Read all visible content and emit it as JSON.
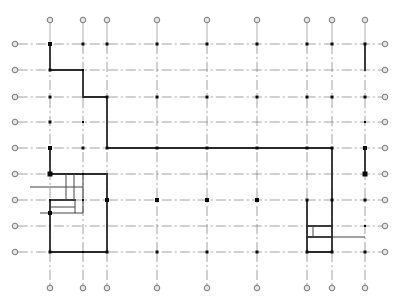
{
  "drawing": {
    "title": "Structural grid floor plan",
    "width": 406,
    "height": 303,
    "colors": {
      "grid": "#8a8a8a",
      "wall": "#2a2a2a",
      "column": "#0a0a0a",
      "bubble": "#e6e6e6"
    }
  },
  "grid": {
    "columns_x": [
      50,
      83,
      107,
      157,
      207,
      257,
      307,
      332,
      365
    ],
    "rows_y": [
      44,
      70,
      97,
      122,
      148,
      174,
      200,
      226,
      252
    ],
    "top_bubble_y": 20,
    "bottom_bubble_y": 288,
    "left_bubble_x": 15,
    "right_bubble_x": 385,
    "bubble_radius": 2.8
  },
  "columns": [
    {
      "x": 50,
      "y": 44,
      "s": 4
    },
    {
      "x": 83,
      "y": 44,
      "s": 3
    },
    {
      "x": 107,
      "y": 44,
      "s": 3
    },
    {
      "x": 157,
      "y": 44,
      "s": 3
    },
    {
      "x": 207,
      "y": 44,
      "s": 3
    },
    {
      "x": 257,
      "y": 44,
      "s": 3
    },
    {
      "x": 307,
      "y": 44,
      "s": 3
    },
    {
      "x": 332,
      "y": 44,
      "s": 3
    },
    {
      "x": 365,
      "y": 44,
      "s": 3
    },
    {
      "x": 50,
      "y": 70,
      "s": 3
    },
    {
      "x": 83,
      "y": 70,
      "s": 2
    },
    {
      "x": 50,
      "y": 97,
      "s": 3
    },
    {
      "x": 107,
      "y": 97,
      "s": 3
    },
    {
      "x": 157,
      "y": 97,
      "s": 3
    },
    {
      "x": 207,
      "y": 97,
      "s": 3
    },
    {
      "x": 257,
      "y": 97,
      "s": 3
    },
    {
      "x": 307,
      "y": 97,
      "s": 3
    },
    {
      "x": 332,
      "y": 97,
      "s": 3
    },
    {
      "x": 365,
      "y": 97,
      "s": 3
    },
    {
      "x": 50,
      "y": 122,
      "s": 3
    },
    {
      "x": 83,
      "y": 122,
      "s": 2
    },
    {
      "x": 365,
      "y": 122,
      "s": 2
    },
    {
      "x": 50,
      "y": 148,
      "s": 4
    },
    {
      "x": 83,
      "y": 148,
      "s": 3
    },
    {
      "x": 107,
      "y": 148,
      "s": 3
    },
    {
      "x": 157,
      "y": 148,
      "s": 3
    },
    {
      "x": 207,
      "y": 148,
      "s": 3
    },
    {
      "x": 257,
      "y": 148,
      "s": 3
    },
    {
      "x": 307,
      "y": 148,
      "s": 3
    },
    {
      "x": 332,
      "y": 148,
      "s": 3
    },
    {
      "x": 365,
      "y": 148,
      "s": 4
    },
    {
      "x": 50,
      "y": 174,
      "s": 5
    },
    {
      "x": 83,
      "y": 174,
      "s": 2
    },
    {
      "x": 365,
      "y": 174,
      "s": 5
    },
    {
      "x": 107,
      "y": 200,
      "s": 4
    },
    {
      "x": 157,
      "y": 200,
      "s": 4
    },
    {
      "x": 207,
      "y": 200,
      "s": 4
    },
    {
      "x": 257,
      "y": 200,
      "s": 4
    },
    {
      "x": 307,
      "y": 200,
      "s": 3
    },
    {
      "x": 332,
      "y": 200,
      "s": 3
    },
    {
      "x": 365,
      "y": 200,
      "s": 3
    },
    {
      "x": 83,
      "y": 200,
      "s": 2
    },
    {
      "x": 50,
      "y": 200,
      "s": 2
    },
    {
      "x": 50,
      "y": 213,
      "s": 4
    },
    {
      "x": 365,
      "y": 226,
      "s": 2
    },
    {
      "x": 50,
      "y": 252,
      "s": 3
    },
    {
      "x": 83,
      "y": 252,
      "s": 2
    },
    {
      "x": 107,
      "y": 252,
      "s": 3
    },
    {
      "x": 157,
      "y": 252,
      "s": 3
    },
    {
      "x": 207,
      "y": 252,
      "s": 3
    },
    {
      "x": 257,
      "y": 252,
      "s": 3
    },
    {
      "x": 307,
      "y": 252,
      "s": 3
    },
    {
      "x": 332,
      "y": 252,
      "s": 3
    },
    {
      "x": 365,
      "y": 252,
      "s": 3
    }
  ],
  "walls": [
    "M50 44 L50 70 L83 70 L83 97 L107 97 L107 148 L332 148 L332 252 L307 252 L307 200",
    "M365 44 L365 70",
    "M365 148 L365 174",
    "M50 148 L50 174",
    "M50 174 L107 174 L107 252 L50 252 L50 200",
    "M50 200 L75 200",
    "M307 226 L332 226",
    "M307 237 L332 237"
  ],
  "thin_lines": [
    "M66 174 L66 200",
    "M74 174 L74 200",
    "M83 174 L83 213",
    "M50 187 L83 187",
    "M50 207 L75 207",
    "M75 200 L75 213",
    "M50 213 L83 213",
    "M30 187 L50 187",
    "M40 213 L50 213",
    "M313 226 L313 237",
    "M332 237 L365 237"
  ]
}
